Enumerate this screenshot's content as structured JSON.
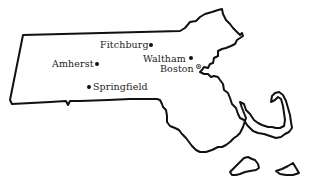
{
  "map": {
    "region": "Massachusetts",
    "colors": {
      "outline": "#111111",
      "background": "#ffffff",
      "text": "#222222"
    },
    "cities": [
      {
        "name": "Fitchburg",
        "marker": "dot"
      },
      {
        "name": "Amherst",
        "marker": "dot"
      },
      {
        "name": "Waltham",
        "marker": "dot"
      },
      {
        "name": "Boston",
        "marker": "capital-star"
      },
      {
        "name": "Springfield",
        "marker": "dot"
      }
    ]
  }
}
